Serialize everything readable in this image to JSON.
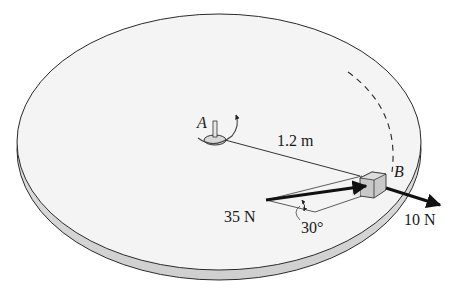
{
  "figure": {
    "colors": {
      "disk_top": "#f4f4f4",
      "disk_edge": "#dcdcdc",
      "outline": "#2a2a2a",
      "block": "#c8c8c8",
      "arrow": "#111111"
    }
  },
  "labels": {
    "point_a": "A",
    "point_b": "B",
    "radius": "1.2 m",
    "force_1": "35 N",
    "force_2": "10 N",
    "angle": "30°"
  }
}
